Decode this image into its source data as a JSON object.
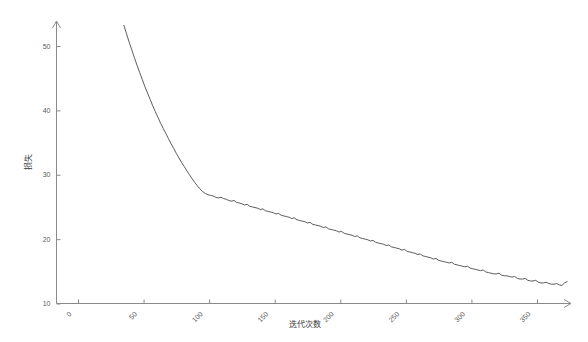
{
  "chart_data": {
    "type": "line",
    "title": "",
    "subtitle": "",
    "xlabel": "迭代次数",
    "ylabel": "损失",
    "xlim": [
      -5,
      365
    ],
    "ylim": [
      10,
      53
    ],
    "grid": false,
    "legend": null,
    "xticks": [
      0,
      50,
      100,
      150,
      200,
      250,
      300,
      350
    ],
    "xtick_labels": [
      "0",
      "50",
      "100",
      "150",
      "200",
      "250",
      "300",
      "350"
    ],
    "yticks": [
      10,
      20,
      30,
      40,
      50
    ],
    "ytick_labels": [
      "10",
      "20",
      "30",
      "40",
      "50"
    ],
    "series": [
      {
        "name": "损失",
        "color": "#4a4a4a",
        "x": [
          35,
          37,
          39,
          41,
          43,
          45,
          47,
          49,
          51,
          53,
          55,
          57,
          59,
          61,
          63,
          65,
          67,
          69,
          71,
          73,
          75,
          77,
          79,
          81,
          83,
          85,
          87,
          89,
          91,
          93,
          95,
          97,
          99,
          101,
          103,
          105,
          107,
          109,
          111,
          113,
          115,
          117,
          119,
          121,
          123,
          125,
          127,
          129,
          131,
          133,
          135,
          137,
          139,
          141,
          143,
          145,
          147,
          149,
          151,
          153,
          155,
          157,
          159,
          161,
          163,
          165,
          167,
          169,
          171,
          173,
          175,
          177,
          179,
          181,
          183,
          185,
          187,
          189,
          191,
          193,
          195,
          197,
          199,
          201,
          203,
          205,
          207,
          209,
          211,
          213,
          215,
          217,
          219,
          221,
          223,
          225,
          227,
          229,
          231,
          233,
          235,
          237,
          239,
          241,
          243,
          245,
          247,
          249,
          251,
          253,
          255,
          257,
          259,
          261,
          263,
          265,
          267,
          269,
          271,
          273,
          275,
          277,
          279,
          281,
          283,
          285,
          287,
          289,
          291,
          293,
          295,
          297,
          299,
          301,
          303,
          305,
          307,
          309,
          311,
          313,
          315,
          317,
          319,
          321,
          323,
          325,
          327,
          329,
          331,
          333,
          335,
          337,
          339,
          341,
          343,
          345,
          347,
          349,
          351,
          353,
          355,
          357,
          359,
          361,
          363,
          365,
          367,
          369,
          371,
          373
        ],
        "y": [
          53.2,
          51.9,
          50.6,
          49.4,
          48.2,
          47.0,
          45.9,
          44.8,
          43.7,
          42.7,
          41.7,
          40.7,
          39.8,
          38.9,
          38.0,
          37.2,
          36.4,
          35.6,
          34.8,
          34.1,
          33.3,
          32.6,
          31.9,
          31.3,
          30.6,
          30.0,
          29.4,
          28.8,
          28.3,
          27.8,
          27.4,
          27.1,
          26.9,
          26.8,
          26.7,
          26.5,
          26.4,
          26.5,
          26.3,
          26.2,
          26.0,
          25.9,
          26.0,
          25.7,
          25.6,
          25.5,
          25.3,
          25.4,
          25.1,
          25.0,
          24.9,
          24.8,
          24.6,
          24.7,
          24.4,
          24.3,
          24.2,
          24.1,
          23.9,
          24.0,
          23.7,
          23.6,
          23.5,
          23.4,
          23.2,
          23.3,
          23.0,
          22.9,
          22.8,
          22.7,
          22.5,
          22.6,
          22.3,
          22.2,
          22.1,
          22.0,
          21.8,
          21.9,
          21.6,
          21.5,
          21.4,
          21.3,
          21.1,
          21.2,
          20.9,
          20.8,
          20.7,
          20.6,
          20.4,
          20.5,
          20.2,
          20.1,
          20.0,
          19.9,
          19.7,
          19.8,
          19.5,
          19.4,
          19.3,
          19.2,
          19.0,
          19.1,
          18.8,
          18.7,
          18.6,
          18.5,
          18.3,
          18.4,
          18.1,
          18.0,
          17.9,
          17.8,
          17.6,
          17.7,
          17.4,
          17.3,
          17.2,
          17.1,
          16.9,
          17.0,
          16.7,
          16.6,
          16.5,
          16.4,
          16.3,
          16.4,
          16.1,
          16.0,
          15.9,
          15.8,
          15.7,
          15.8,
          15.5,
          15.4,
          15.3,
          15.2,
          15.1,
          15.2,
          14.9,
          14.8,
          14.7,
          14.6,
          14.6,
          14.7,
          14.4,
          14.3,
          14.3,
          14.2,
          14.1,
          14.2,
          13.9,
          13.8,
          13.8,
          13.9,
          13.6,
          13.5,
          13.5,
          13.6,
          13.3,
          13.2,
          13.2,
          13.3,
          13.1,
          13.0,
          13.0,
          13.1,
          12.9,
          12.8,
          13.2,
          13.4
        ]
      }
    ]
  },
  "axes": {
    "y_title": "损失",
    "x_title": "迭代次数"
  }
}
